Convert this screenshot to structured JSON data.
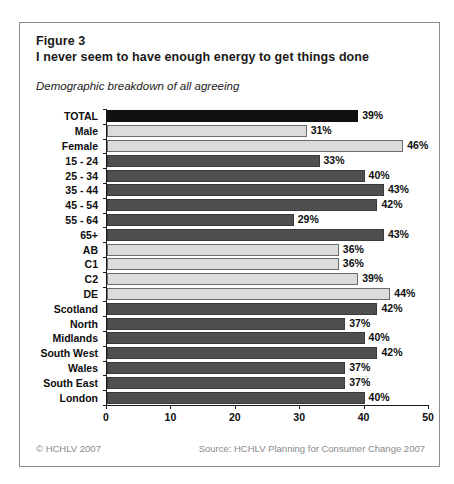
{
  "figure": {
    "label": "Figure 3",
    "title": "I never seem to have enough energy to get things done",
    "subtitle": "Demographic breakdown of all agreeing"
  },
  "footer": {
    "copyright": "© HCHLV 2007",
    "source": "Source: HCHLV Planning for Consumer Change 2007"
  },
  "colors": {
    "total_bar": "#111111",
    "dark_bar": "#4f4f4f",
    "light_bar": "#dcdcdc",
    "border": "#8c8c8c",
    "axis": "#1a1a1a",
    "footer_text": "#8a8a8a"
  },
  "chart_data": {
    "type": "bar",
    "orientation": "horizontal",
    "title": "I never seem to have enough energy to get things done",
    "subtitle": "Demographic breakdown of all agreeing",
    "xlabel": "",
    "ylabel": "",
    "xlim": [
      0,
      50
    ],
    "xticks": [
      0,
      10,
      20,
      30,
      40,
      50
    ],
    "xtick_labels": [
      "0",
      "10",
      "20",
      "30",
      "40",
      "50"
    ],
    "grid": false,
    "legend": false,
    "value_suffix": "%",
    "categories": [
      "TOTAL",
      "Male",
      "Female",
      "15 - 24",
      "25 - 34",
      "35 - 44",
      "45 - 54",
      "55 - 64",
      "65+",
      "AB",
      "C1",
      "C2",
      "DE",
      "Scotland",
      "North",
      "Midlands",
      "South West",
      "Wales",
      "South East",
      "London"
    ],
    "values": [
      39,
      31,
      46,
      33,
      40,
      43,
      42,
      29,
      43,
      36,
      36,
      39,
      44,
      42,
      37,
      40,
      42,
      37,
      37,
      40
    ],
    "value_labels": [
      "39%",
      "31%",
      "46%",
      "33%",
      "40%",
      "43%",
      "42%",
      "29%",
      "43%",
      "36%",
      "36%",
      "39%",
      "44%",
      "42%",
      "37%",
      "40%",
      "42%",
      "37%",
      "37%",
      "40%"
    ],
    "bar_styles": [
      "dark",
      "light",
      "light",
      "mid",
      "mid",
      "mid",
      "mid",
      "mid",
      "mid",
      "light",
      "light",
      "light",
      "light",
      "mid",
      "mid",
      "mid",
      "mid",
      "mid",
      "mid",
      "mid"
    ]
  }
}
